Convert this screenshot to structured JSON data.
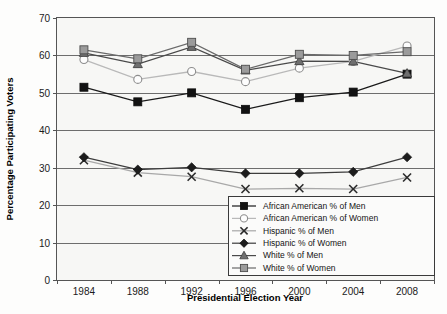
{
  "chart_data": {
    "type": "line",
    "title": "",
    "xlabel": "Presidential Election Year",
    "ylabel": "Percentage Participating Voters",
    "categories": [
      "1984",
      "1988",
      "1992",
      "1996",
      "2000",
      "2004",
      "2008"
    ],
    "x": [
      1984,
      1988,
      1992,
      1996,
      2000,
      2004,
      2008
    ],
    "ylim": [
      0,
      70
    ],
    "yticks": [
      0,
      10,
      20,
      30,
      40,
      50,
      60,
      70
    ],
    "grid": true,
    "legend_position": "inside-bottom-right",
    "series": [
      {
        "name": "African American % of Men",
        "marker": "filled-square",
        "marker_color": "#121212",
        "line_color": "#1a1a1a",
        "values": [
          51.5,
          47.6,
          50.0,
          45.6,
          48.7,
          50.2,
          55.0
        ]
      },
      {
        "name": "African American % of Women",
        "marker": "open-circle",
        "marker_color": "#ffffff",
        "line_color": "#b9b9b9",
        "values": [
          58.9,
          53.6,
          55.7,
          53.0,
          56.6,
          58.4,
          62.5
        ]
      },
      {
        "name": "Hispanic % of Men",
        "marker": "x-cross",
        "marker_color": "#2b2b2b",
        "line_color": "#a8a8a8",
        "values": [
          32.0,
          28.7,
          27.6,
          24.3,
          24.5,
          24.3,
          27.4
        ]
      },
      {
        "name": "Hispanic % of Women",
        "marker": "filled-diamond",
        "marker_color": "#1c1c1c",
        "line_color": "#3d3d3d",
        "values": [
          32.8,
          29.5,
          30.1,
          28.5,
          28.5,
          28.9,
          32.8
        ]
      },
      {
        "name": "White % of Men",
        "marker": "filled-triangle",
        "marker_color": "#6f6f6f",
        "line_color": "#4a4a4a",
        "values": [
          60.7,
          57.7,
          62.3,
          56.0,
          58.5,
          58.4,
          55.2
        ]
      },
      {
        "name": "White % of Women",
        "marker": "filled-square-gray",
        "marker_color": "#9b9b9b",
        "line_color": "#6a6a6a",
        "values": [
          61.5,
          59.1,
          63.5,
          56.3,
          60.3,
          60.0,
          61.0
        ]
      }
    ]
  },
  "axes": {
    "y_title": "Percentage Participating Voters",
    "x_title": "Presidential Election Year",
    "y_tick_labels": [
      "0",
      "10",
      "20",
      "30",
      "40",
      "50",
      "60",
      "70"
    ],
    "x_tick_labels": [
      "1984",
      "1988",
      "1992",
      "1996",
      "2000",
      "2004",
      "2008"
    ]
  },
  "legend": {
    "items": [
      {
        "label": "African American % of Men"
      },
      {
        "label": "African American % of Women"
      },
      {
        "label": "Hispanic % of Men"
      },
      {
        "label": "Hispanic % of Women"
      },
      {
        "label": "White % of Men"
      },
      {
        "label": "White % of Women"
      }
    ]
  }
}
